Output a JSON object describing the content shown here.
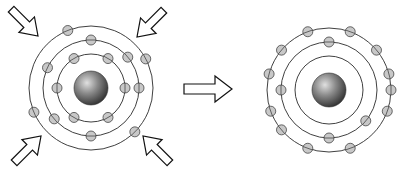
{
  "diagram": {
    "left_atom": {
      "center": [
        91,
        88
      ],
      "nucleus_radius": 17,
      "orbits": [
        34,
        48,
        62
      ],
      "electrons": [
        {
          "orbit": 0,
          "angle": -120
        },
        {
          "orbit": 0,
          "angle": -60
        },
        {
          "orbit": 0,
          "angle": 0
        },
        {
          "orbit": 0,
          "angle": 60
        },
        {
          "orbit": 0,
          "angle": 120
        },
        {
          "orbit": 0,
          "angle": 180
        },
        {
          "orbit": 1,
          "angle": -90
        },
        {
          "orbit": 1,
          "angle": -40
        },
        {
          "orbit": 1,
          "angle": 0
        },
        {
          "orbit": 1,
          "angle": 90
        },
        {
          "orbit": 1,
          "angle": 140
        },
        {
          "orbit": 1,
          "angle": -155
        },
        {
          "orbit": 2,
          "angle": -112
        },
        {
          "orbit": 2,
          "angle": -28
        },
        {
          "orbit": 2,
          "angle": 45
        },
        {
          "orbit": 2,
          "angle": 157
        }
      ],
      "inward_arrows": [
        "top-left",
        "top-right",
        "bottom-left",
        "bottom-right"
      ]
    },
    "transition_arrow": {
      "direction": "right"
    },
    "right_atom": {
      "center": [
        329,
        90
      ],
      "nucleus_radius": 17,
      "orbits": [
        34,
        48,
        62
      ],
      "electrons": [
        {
          "orbit": 1,
          "angle": -90
        },
        {
          "orbit": 1,
          "angle": 180
        },
        {
          "orbit": 1,
          "angle": 90
        },
        {
          "orbit": 1,
          "angle": 40
        },
        {
          "orbit": 2,
          "angle": -110
        },
        {
          "orbit": 2,
          "angle": -70
        },
        {
          "orbit": 2,
          "angle": -140
        },
        {
          "orbit": 2,
          "angle": -40
        },
        {
          "orbit": 2,
          "angle": -165
        },
        {
          "orbit": 2,
          "angle": -15
        },
        {
          "orbit": 2,
          "angle": 0
        },
        {
          "orbit": 2,
          "angle": 20
        },
        {
          "orbit": 2,
          "angle": 160
        },
        {
          "orbit": 2,
          "angle": 140
        },
        {
          "orbit": 2,
          "angle": 110
        },
        {
          "orbit": 2,
          "angle": 70
        }
      ]
    },
    "colors": {
      "orbit": "#2a2a2a",
      "electron_fill": "#c8c8c8",
      "nucleus_light": "#d8d8d8",
      "nucleus_dark": "#3a3a3a",
      "arrow_fill": "#ffffff",
      "arrow_stroke": "#111111"
    }
  }
}
